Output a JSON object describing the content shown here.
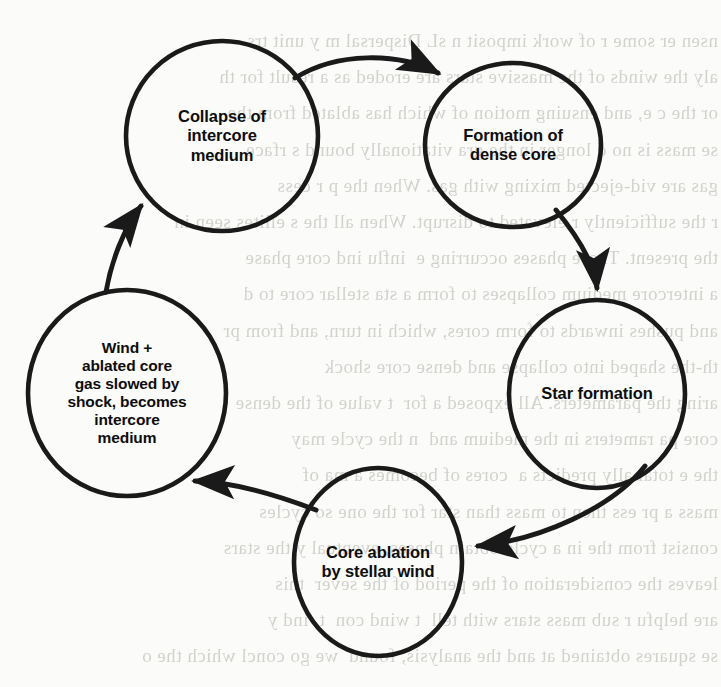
{
  "diagram": {
    "type": "cycle-flow-diagram",
    "title": "",
    "nodes": [
      {
        "id": "collapse",
        "label": "Collapse of\nintercore\nmedium",
        "lines": [
          "Collapse of",
          "intercore",
          "medium"
        ],
        "cx": 222,
        "cy": 136,
        "rx": 96,
        "ry": 95
      },
      {
        "id": "dense-core",
        "label": "Formation of\ndense core",
        "lines": [
          "Formation of",
          "dense core"
        ],
        "cx": 513,
        "cy": 145,
        "rx": 88,
        "ry": 82
      },
      {
        "id": "star-formation",
        "label": "Star formation",
        "lines": [
          "Star formation"
        ],
        "cx": 597,
        "cy": 394,
        "rx": 88,
        "ry": 94
      },
      {
        "id": "core-ablation",
        "label": "Core ablation\nby stellar wind",
        "lines": [
          "Core ablation",
          "by stellar wind"
        ],
        "cx": 378,
        "cy": 562,
        "rx": 84,
        "ry": 94
      },
      {
        "id": "intercore-medium",
        "label": "Wind +\nablated core\ngas slowed by\nshock, becomes\nintercore\nmedium",
        "lines": [
          "Wind +",
          "ablated core",
          "gas slowed by",
          "shock, becomes",
          "intercore",
          "medium"
        ],
        "cx": 127,
        "cy": 393,
        "rx": 99,
        "ry": 103
      }
    ],
    "edges": [
      {
        "id": "edge-collapse-to-dense-core",
        "from": "collapse",
        "to": "dense-core",
        "label": ""
      },
      {
        "id": "edge-dense-core-to-star-formation",
        "from": "dense-core",
        "to": "star-formation",
        "label": ""
      },
      {
        "id": "edge-star-formation-to-core-ablation",
        "from": "star-formation",
        "to": "core-ablation",
        "label": ""
      },
      {
        "id": "edge-core-ablation-to-intercore-medium",
        "from": "core-ablation",
        "to": "intercore-medium",
        "label": ""
      },
      {
        "id": "edge-intercore-medium-to-collapse",
        "from": "intercore-medium",
        "to": "collapse",
        "label": ""
      }
    ],
    "colors": {
      "stroke": "#1a1a1a",
      "text": "#0d0d0d",
      "page": "#fbfbf9",
      "bleed_text": "#9a9a92"
    }
  },
  "background_bleed": {
    "note": "faint mirrored show-through text from the reverse side of the scanned page",
    "lines": [
      "nsen er some r of work imposit n sL Dispersal m y unit trs",
      "aly the winds of the massive stars are eroded as a result for th",
      "or the c e, and ensuing motion of which has ablated from the",
      "se mass is no d longer in the gra vitationally bound s rface",
      "gas are vid-ejected mixing with gas. When the p r cess",
      "r the sufficiently r elevated to disrupt. When all the s ellites seen in",
      "the present. These phases occurring e  influ ind core phase",
      "a intercore medium collapses to form a sta stellar core to d",
      "and pushes inwards to form cores, which in turn, and from pr",
      "th-the shaped into collapse and dense core shock",
      "aring the parameters. All exposed a for  t value of the dense",
      "core pa rameters in the medium and  n the cycle may",
      "the e total ally predicts a  cores of becomes a ma of",
      "mass a pr ess then to mass than star for the one so cycles",
      "consist from the in a cycle obtain phases, eventual y the stars",
      "leaves the consideration of the period of the sever  this",
      "are helpfu r sub mass stars with tell  t wind con  t  ind y",
      "se squares obtained at and the analysis, found  we go concl which the o"
    ]
  }
}
